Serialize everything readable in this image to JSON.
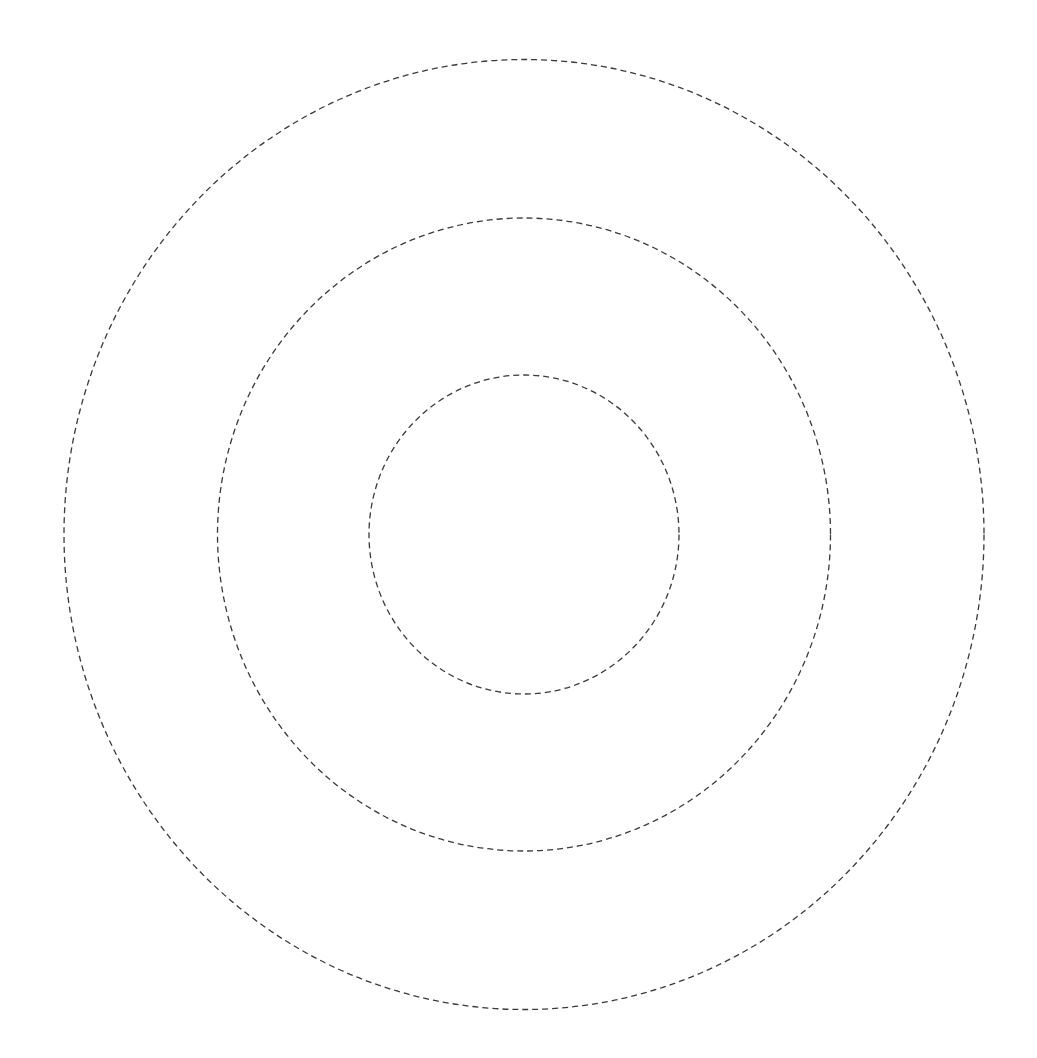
{
  "diagram": {
    "type": "concentric-circles",
    "background": "#ffffff",
    "stroke_color": "#3a3a3a",
    "dash_pattern": "6 4",
    "center": {
      "x": 524,
      "y": 534.5
    },
    "rings": [
      {
        "name": "outer-ring",
        "rx": 460,
        "ry": 475
      },
      {
        "name": "middle-ring",
        "rx": 306.5,
        "ry": 316.5
      },
      {
        "name": "inner-ring",
        "rx": 155,
        "ry": 159.5
      }
    ]
  }
}
